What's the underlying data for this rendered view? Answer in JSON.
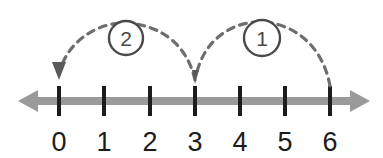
{
  "figure": {
    "kind": "number-line-diagram",
    "background_color": "#ffffff",
    "width": 383,
    "height": 158
  },
  "axis": {
    "name": "number-line-axis",
    "color": "#9a9a9a",
    "tick_color": "#1c1c1c",
    "line_y": 101,
    "left_tip_x": 18,
    "right_tip_x": 370,
    "left_arrow": "arrow-left",
    "right_arrow": "arrow-right",
    "tick_top_y": 86,
    "tick_bottom_y": 116,
    "label_baseline_y": 151
  },
  "ticks": [
    {
      "label": "0",
      "x": 59
    },
    {
      "label": "1",
      "x": 104
    },
    {
      "label": "2",
      "x": 150
    },
    {
      "label": "3",
      "x": 195
    },
    {
      "label": "4",
      "x": 240
    },
    {
      "label": "5",
      "x": 285
    },
    {
      "label": "6",
      "x": 330
    }
  ],
  "jumps": [
    {
      "name": "jump-arc-2",
      "label": "2",
      "from_value": "3",
      "to_value": "0",
      "from_x": 195,
      "to_x": 59,
      "apex_y": 30,
      "start_y": 78,
      "end_y": 74,
      "arrowhead": "down-arrowhead-at-0",
      "arrowhead_x": 59,
      "arrowhead_tip_y": 79,
      "badge_cx": 126,
      "badge_cy": 38,
      "badge_r": 17,
      "stroke_color": "#6e6e6e",
      "dash_pattern": "7 6"
    },
    {
      "name": "jump-arc-1",
      "label": "1",
      "from_value": "6",
      "to_value": "3",
      "from_x": 330,
      "to_x": 195,
      "apex_y": 28,
      "start_y": 86,
      "end_y": 72,
      "arrowhead": "tick-taper-at-3",
      "arrowhead_x": 195,
      "arrowhead_tip_y": 82,
      "badge_cx": 262,
      "badge_cy": 38,
      "badge_r": 18,
      "stroke_color": "#6e6e6e",
      "dash_pattern": "7 6"
    }
  ],
  "colors": {
    "axis_gray": "#9a9a9a",
    "tick_black": "#1c1c1c",
    "arc_gray": "#6e6e6e",
    "badge_gray": "#4a4a4a"
  }
}
